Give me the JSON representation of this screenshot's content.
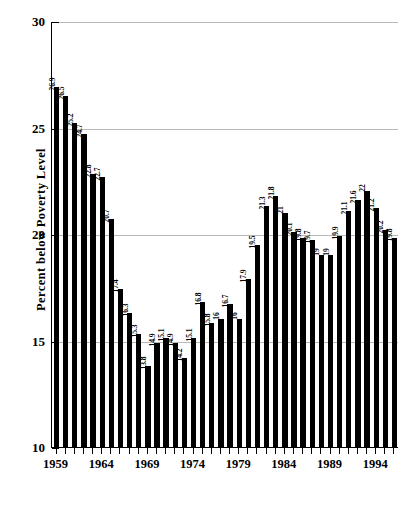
{
  "chart_data": {
    "type": "bar",
    "title": "",
    "xlabel": "",
    "ylabel": "Percent below Poverty Level",
    "ylim": [
      10,
      30
    ],
    "ytick_labels": [
      "10",
      "15",
      "20",
      "25",
      "30"
    ],
    "ytick_values": [
      10,
      15,
      20,
      25,
      30
    ],
    "grid": true,
    "legend": "none",
    "xtick_labels": [
      "1959",
      "1964",
      "1969",
      "1974",
      "1979",
      "1984",
      "1989",
      "1994"
    ],
    "xtick_years": [
      1959,
      1964,
      1969,
      1974,
      1979,
      1984,
      1989,
      1994
    ],
    "categories": [
      "1959",
      "1960",
      "1961",
      "1962",
      "1963",
      "1964",
      "1965",
      "1966",
      "1967",
      "1968",
      "1969",
      "1970",
      "1971",
      "1972",
      "1973",
      "1974",
      "1975",
      "1976",
      "1977",
      "1978",
      "1979",
      "1980",
      "1981",
      "1982",
      "1983",
      "1984",
      "1985",
      "1986",
      "1987",
      "1988",
      "1989",
      "1990",
      "1991",
      "1992",
      "1993",
      "1994",
      "1995",
      "1996"
    ],
    "values": [
      26.9,
      26.5,
      25.2,
      24.7,
      22.8,
      22.7,
      20.7,
      17.4,
      16.3,
      15.3,
      13.8,
      14.9,
      15.1,
      14.9,
      14.2,
      15.1,
      16.8,
      15.8,
      16.0,
      16.7,
      16.0,
      17.9,
      19.5,
      21.3,
      21.8,
      21.0,
      20.1,
      19.8,
      19.7,
      19.0,
      19.0,
      19.9,
      21.1,
      21.6,
      22.0,
      21.2,
      20.2,
      19.8
    ],
    "value_labels": [
      "26.9",
      "26.5",
      "25.2",
      "24.7",
      "22.8",
      "22.7",
      "20.7",
      "17.4",
      "16.3",
      "15.3",
      "13.8",
      "14.9",
      "15.1",
      "14.9",
      "14.2",
      "15.1",
      "16.8",
      "15.8",
      "16",
      "16.7",
      "16",
      "17.9",
      "19.5",
      "21.3",
      "21.8",
      "21",
      "20.1",
      "19.8",
      "19.7",
      "19",
      "19",
      "19.9",
      "21.1",
      "21.6",
      "22",
      "21.2",
      "20.2",
      "19.8"
    ]
  }
}
